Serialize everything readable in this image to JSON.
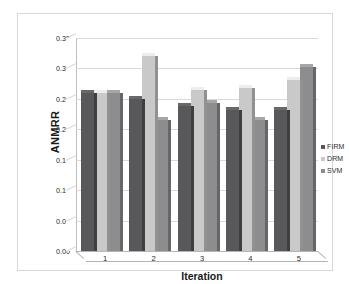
{
  "chart_data": {
    "type": "bar",
    "title": "",
    "xlabel": "Iteration",
    "ylabel": "ANMRR",
    "categories": [
      "1",
      "2",
      "3",
      "4",
      "5"
    ],
    "series": [
      {
        "name": "FIRM",
        "color": "#58585a",
        "values": [
          0.26,
          0.249,
          0.238,
          0.232,
          0.232
        ]
      },
      {
        "name": "DRM",
        "color": "#c9c9c9",
        "values": [
          0.26,
          0.32,
          0.265,
          0.268,
          0.281
        ]
      },
      {
        "name": "SVM",
        "color": "#8d8d8f",
        "values": [
          0.26,
          0.215,
          0.243,
          0.216,
          0.302
        ]
      }
    ],
    "ylim": [
      0.0,
      0.35
    ],
    "ytick_values": [
      0.0,
      0.05,
      0.1,
      0.15,
      0.2,
      0.25,
      0.3,
      0.35
    ],
    "ytick_labels": [
      "0.00",
      "0.05",
      "0.10",
      "0.15",
      "0.20",
      "0.25",
      "0.30",
      "0.35"
    ],
    "grid": true,
    "legend_position": "right",
    "style": "3d-clustered-column"
  },
  "colors": {
    "firm": "#58585a",
    "drm": "#c9c9c9",
    "svm": "#8d8d8f",
    "gridline": "#d9d9d9",
    "axis": "#b4b4b4",
    "frame": "#d8d8d8",
    "text": "#2b2b2b",
    "background": "#ffffff"
  }
}
